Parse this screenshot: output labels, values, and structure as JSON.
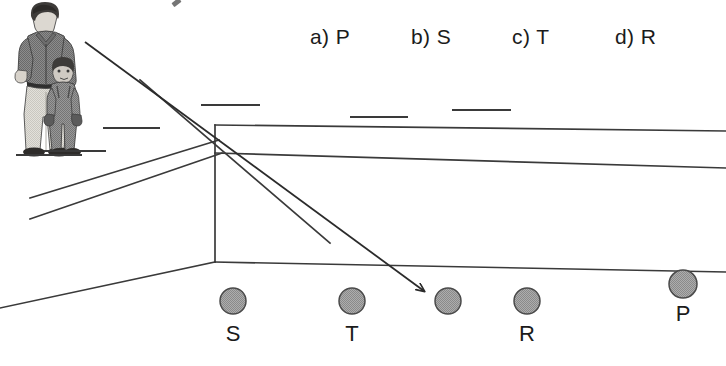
{
  "page": {
    "width": 726,
    "height": 366,
    "background": "#ffffff",
    "ink": "#1b1b1b",
    "line_color": "#3a3a3a"
  },
  "question": {
    "options": [
      {
        "key": "a",
        "label": "a) P",
        "value": "P"
      },
      {
        "key": "b",
        "label": "b) S",
        "value": "S"
      },
      {
        "key": "c",
        "label": "c) T",
        "value": "T"
      },
      {
        "key": "d",
        "label": "d) R",
        "value": "R"
      }
    ]
  },
  "scene": {
    "description": "One-point perspective corridor drawing with a man holding a child's hand at the left, a receding wall, and five gray balls on the floor; an arrow points from the observer to one of the balls.",
    "figure": {
      "name": "man-and-child",
      "subjects": [
        "man",
        "child"
      ],
      "ground_line": true
    },
    "balls": [
      {
        "id": "ball-s",
        "label": "S",
        "cx": 233,
        "cy": 301,
        "r": 13,
        "fill": "#9d9d9d"
      },
      {
        "id": "ball-t",
        "label": "T",
        "cx": 352,
        "cy": 301,
        "r": 13,
        "fill": "#9d9d9d"
      },
      {
        "id": "ball-x",
        "label": "",
        "cx": 448,
        "cy": 301,
        "r": 13,
        "fill": "#9d9d9d"
      },
      {
        "id": "ball-r",
        "label": "R",
        "cx": 527,
        "cy": 301,
        "r": 13,
        "fill": "#9d9d9d"
      },
      {
        "id": "ball-p",
        "label": "P",
        "cx": 683,
        "cy": 284,
        "r": 14,
        "fill": "#9d9d9d"
      }
    ],
    "ball_labels": [
      {
        "text": "S",
        "x": 233,
        "y": 322
      },
      {
        "text": "T",
        "x": 352,
        "y": 322
      },
      {
        "text": "R",
        "x": 527,
        "y": 322
      },
      {
        "text": "P",
        "x": 683,
        "y": 302
      }
    ],
    "arrow": {
      "name": "sight-line-arrow",
      "from": {
        "x": 85,
        "y": 42
      },
      "to": {
        "x": 427,
        "y": 294
      },
      "points_to_ball": "ball-x"
    },
    "corner": {
      "x": 215,
      "y": 125,
      "floor_y": 262
    }
  }
}
